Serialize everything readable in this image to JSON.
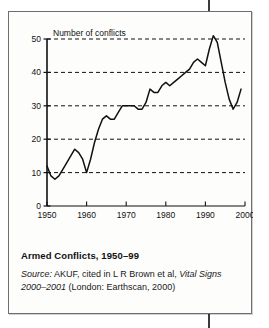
{
  "figure": {
    "caption_title": "Armed Conflicts, 1950–99",
    "source_prefix": "Source:",
    "source_rest": " AKUF, cited in L R Brown et al, ",
    "source_italic_work": "Vital Signs 2000–2001",
    "source_tail": " (London:  Earthscan, 2000)"
  },
  "chart_data": {
    "type": "line",
    "title": "Armed Conflicts, 1950–99",
    "xlabel": "",
    "ylabel": "Number of conflicts",
    "axis_label_inline": "Number of conflicts",
    "xlim": [
      1950,
      2000
    ],
    "ylim": [
      0,
      50
    ],
    "xticks": [
      1950,
      1960,
      1970,
      1980,
      1990,
      2000
    ],
    "xtick_labels": [
      "1950",
      "1960",
      "1970",
      "1980",
      "1990",
      "2000"
    ],
    "yticks": [
      0,
      10,
      20,
      30,
      40,
      50
    ],
    "ytick_labels": [
      "0",
      "10",
      "20",
      "30",
      "40",
      "50"
    ],
    "grid": "horizontal-dashed",
    "gridlines_at": [
      10,
      20,
      30,
      40,
      50
    ],
    "legend": "none",
    "line_color": "#111111",
    "x": [
      1950,
      1951,
      1952,
      1953,
      1954,
      1955,
      1956,
      1957,
      1958,
      1959,
      1960,
      1961,
      1962,
      1963,
      1964,
      1965,
      1966,
      1967,
      1968,
      1969,
      1970,
      1971,
      1972,
      1973,
      1974,
      1975,
      1976,
      1977,
      1978,
      1979,
      1980,
      1981,
      1982,
      1983,
      1984,
      1985,
      1986,
      1987,
      1988,
      1989,
      1990,
      1991,
      1992,
      1993,
      1994,
      1995,
      1996,
      1997,
      1998,
      1999
    ],
    "values": [
      12,
      9,
      8,
      9,
      11,
      13,
      15,
      17,
      16,
      14,
      10,
      14,
      19,
      23,
      26,
      27,
      26,
      26,
      28,
      30,
      30,
      30,
      30,
      29,
      29,
      31,
      35,
      34,
      34,
      36,
      37,
      36,
      37,
      38,
      39,
      40,
      41,
      43,
      44,
      43,
      42,
      47,
      51,
      49,
      43,
      37,
      32,
      29,
      31,
      35
    ]
  }
}
